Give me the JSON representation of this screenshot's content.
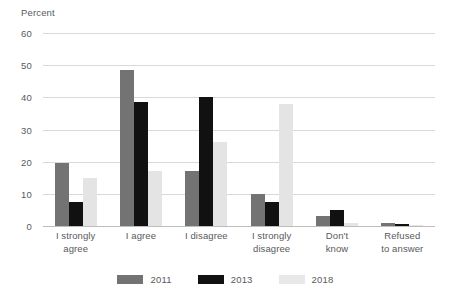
{
  "chart_data": {
    "type": "bar",
    "title": "",
    "subtitle": "",
    "xlabel": "",
    "ylabel": "Percent",
    "ylim": [
      0,
      60
    ],
    "yticks": [
      0,
      10,
      20,
      30,
      40,
      50,
      60
    ],
    "grid": "horizontal",
    "legend_position": "bottom-center",
    "categories": [
      "I strongly\nagree",
      "I agree",
      "I disagree",
      "I strongly\ndisagree",
      "Don't\nknow",
      "Refused\nto answer"
    ],
    "series": [
      {
        "name": "2011",
        "color": "#737373",
        "values": [
          19.5,
          48.5,
          17,
          10,
          3,
          1
        ]
      },
      {
        "name": "2013",
        "color": "#111111",
        "values": [
          7.5,
          38.5,
          40,
          7.5,
          5,
          0.5
        ]
      },
      {
        "name": "2018",
        "color": "#e4e4e4",
        "values": [
          15,
          17,
          26,
          38,
          1,
          0.2
        ]
      }
    ]
  },
  "colors": {
    "series_2011": "#737373",
    "series_2013": "#111111",
    "series_2018": "#e4e4e4",
    "text": "#59595b",
    "gridline": "#d9d9d9",
    "background": "#ffffff"
  }
}
